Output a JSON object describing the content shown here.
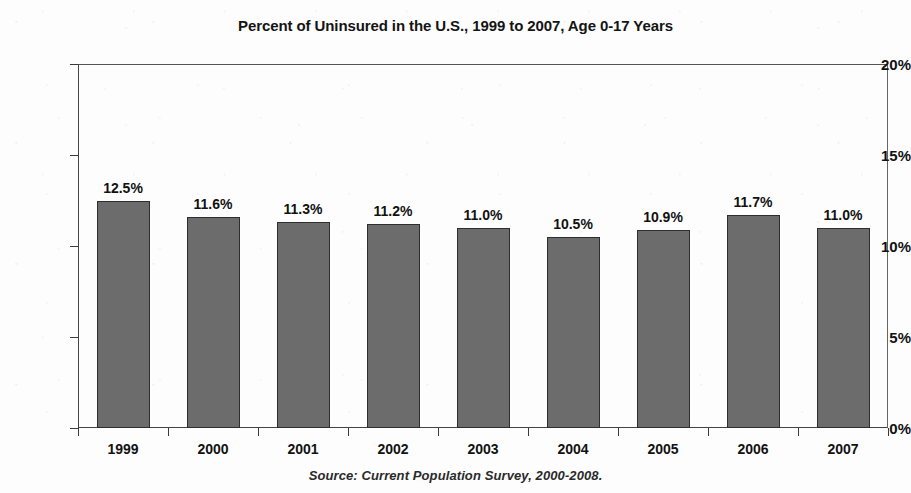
{
  "chart_data": {
    "type": "bar",
    "title": "Percent of Uninsured in the U.S., 1999 to 2007, Age 0-17 Years",
    "xlabel": "",
    "ylabel": "",
    "ylim": [
      0,
      20
    ],
    "grid": false,
    "legend": "none",
    "categories": [
      "1999",
      "2000",
      "2001",
      "2002",
      "2003",
      "2004",
      "2005",
      "2006",
      "2007"
    ],
    "values": [
      12.5,
      11.6,
      11.3,
      11.2,
      11.0,
      10.5,
      10.9,
      11.7,
      11.0
    ],
    "data_labels": [
      "12.5%",
      "11.6%",
      "11.3%",
      "11.2%",
      "11.0%",
      "10.5%",
      "10.9%",
      "11.7%",
      "11.0%"
    ],
    "y_ticks": [
      0,
      5,
      10,
      15,
      20
    ],
    "y_tick_labels": [
      "0%",
      "5%",
      "10%",
      "15%",
      "20%"
    ],
    "series": [
      {
        "name": "Percent uninsured, age 0-17",
        "values": [
          12.5,
          11.6,
          11.3,
          11.2,
          11.0,
          10.5,
          10.9,
          11.7,
          11.0
        ],
        "color": "#6c6c6c"
      }
    ],
    "annotations": {
      "source": "Source:  Current Population Survey, 2000-2008."
    }
  },
  "colors": {
    "bar_fill": "#6c6c6c",
    "bar_border": "#2e2e2e",
    "axis": "#3a3a3a",
    "text": "#121212",
    "background": "#fdfdfd"
  }
}
